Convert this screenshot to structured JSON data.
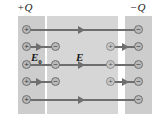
{
  "figure": {
    "title_left_plate": "+Q",
    "title_right_plate": "−Q",
    "field_applied_label": "E",
    "field_applied_sub": "0",
    "field_net_label": "E",
    "colors": {
      "plate_fill": "#cdcdcd",
      "slab_fill": "#d6d6d6",
      "line": "#6e6e6e",
      "charge_fill": "#b9b9b9",
      "charge_stroke": "#6f6f6f",
      "background": "#ffffff",
      "text": "#1a1a1a"
    },
    "left_plate_charges": [
      {
        "symbol": "+"
      },
      {
        "symbol": "+"
      },
      {
        "symbol": "+"
      },
      {
        "symbol": "+"
      },
      {
        "symbol": "+"
      }
    ],
    "right_plate_charges": [
      {
        "symbol": "−"
      },
      {
        "symbol": "−"
      },
      {
        "symbol": "−"
      },
      {
        "symbol": "−"
      },
      {
        "symbol": "−"
      }
    ],
    "slab_left_face_charges": [
      {
        "symbol": "−"
      },
      {
        "symbol": "−"
      },
      {
        "symbol": "−"
      }
    ],
    "slab_right_face_charges": [
      {
        "symbol": "+"
      },
      {
        "symbol": "+"
      },
      {
        "symbol": "+"
      }
    ],
    "long_field_lines": 3,
    "short_field_lines": 4
  }
}
